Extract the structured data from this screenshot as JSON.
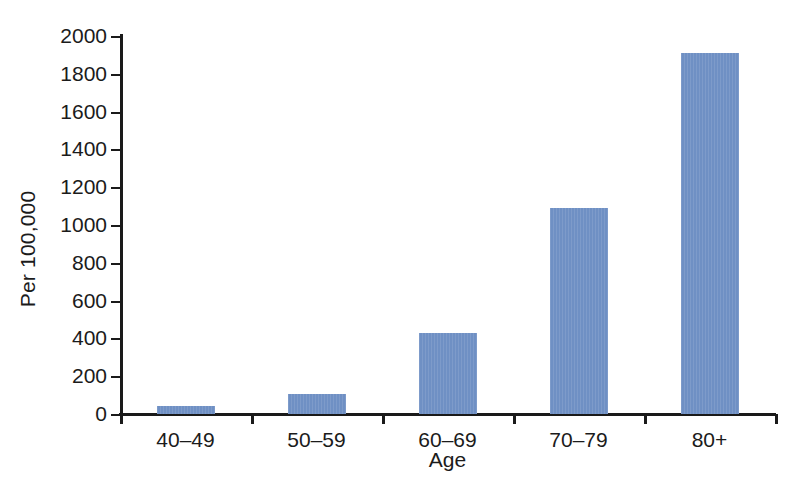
{
  "chart_data": {
    "type": "bar",
    "title": "",
    "subtitle": "",
    "xlabel": "Age",
    "ylabel": "Per 100,000",
    "categories": [
      "40–49",
      "50–59",
      "60–69",
      "70–79",
      "80+"
    ],
    "values": [
      40,
      105,
      428,
      1090,
      1910
    ],
    "ylim": [
      0,
      2000
    ],
    "y_ticks": [
      0,
      200,
      400,
      600,
      800,
      1000,
      1200,
      1400,
      1600,
      1800,
      2000
    ],
    "y_tick_labels": [
      "0",
      "200",
      "400",
      "600",
      "800",
      "1000",
      "1200",
      "1400",
      "1600",
      "1800",
      "2000"
    ],
    "grid": false,
    "legend": null,
    "legend_position": "none",
    "bar_color": "#6f90c4",
    "axis_color": "#1a1a1a",
    "background_color": "#ffffff",
    "annotations": []
  }
}
